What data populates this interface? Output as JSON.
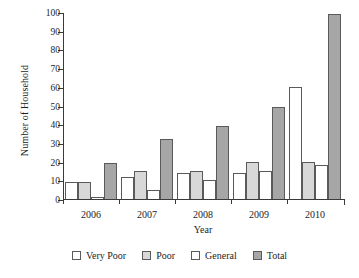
{
  "chart_data": {
    "type": "bar",
    "title": "",
    "xlabel": "Year",
    "ylabel": "Number of Household",
    "categories": [
      "2006",
      "2007",
      "2008",
      "2009",
      "2010"
    ],
    "series": [
      {
        "name": "Very Poor",
        "color": "#ffffff",
        "values": [
          9,
          12,
          14,
          14,
          60
        ]
      },
      {
        "name": "Poor",
        "color": "#d8d8d8",
        "values": [
          9,
          15,
          15,
          20,
          20
        ]
      },
      {
        "name": "General",
        "color": "#ffffff",
        "values": [
          1,
          5,
          10,
          15,
          18
        ]
      },
      {
        "name": "Total",
        "color": "#a6a6a6",
        "values": [
          19,
          32,
          39,
          49,
          99
        ]
      }
    ],
    "ylim": [
      0,
      100
    ],
    "ytick_values": [
      0,
      10,
      20,
      30,
      40,
      50,
      60,
      70,
      80,
      90,
      100
    ],
    "ytick_labels": [
      "0",
      "10",
      "20",
      "30",
      "40",
      "50",
      "60",
      "70",
      "80",
      "90",
      "100"
    ],
    "grid": false,
    "legend_position": "bottom"
  }
}
